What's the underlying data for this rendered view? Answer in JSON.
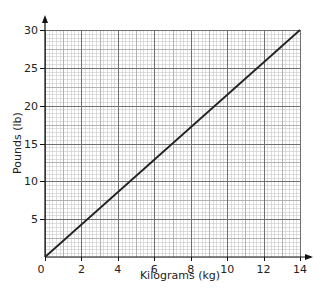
{
  "chart_data": {
    "type": "line",
    "title": "",
    "xlabel": "Kilograms (kg)",
    "ylabel": "Pounds (lb)",
    "xlim": [
      0,
      14
    ],
    "ylim": [
      0,
      30
    ],
    "x_ticks": [
      0,
      2,
      4,
      6,
      8,
      10,
      12,
      14
    ],
    "y_ticks": [
      5,
      10,
      15,
      20,
      25,
      30
    ],
    "origin_label": "0",
    "grid": true,
    "minor_grid": {
      "x_step": 0.2,
      "y_step": 0.5
    },
    "legend": null,
    "series": [
      {
        "name": "kg to lb conversion",
        "x": [
          0,
          14
        ],
        "y": [
          0,
          30
        ],
        "color": "#222222"
      }
    ]
  },
  "colors": {
    "line": "#222222",
    "major_grid": "#707070",
    "minor_grid": "#c8c8c8",
    "axis": "#111111"
  }
}
